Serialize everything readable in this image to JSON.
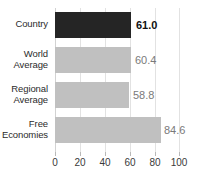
{
  "chart_data": {
    "type": "bar",
    "orientation": "horizontal",
    "title": "",
    "xlabel": "",
    "ylabel": "",
    "categories": [
      "Country",
      "World Average",
      "Regional Average",
      "Free Economies"
    ],
    "values": [
      61.0,
      60.4,
      58.8,
      84.6
    ],
    "value_labels": [
      "61.0",
      "60.4",
      "58.8",
      "84.6"
    ],
    "xlim": [
      0,
      100
    ],
    "xticks": [
      0,
      20,
      40,
      60,
      80,
      100
    ],
    "xtick_labels": [
      "0",
      "20",
      "40",
      "60",
      "80",
      "100"
    ],
    "grid": true,
    "legend": "none",
    "bar_colors": [
      "#252525",
      "#c0c0c0",
      "#c0c0c0",
      "#c0c0c0"
    ],
    "highlight_index": 0
  },
  "labels": {
    "cat0_line1": "Country",
    "cat0_line2": "",
    "cat1_line1": "World",
    "cat1_line2": "Average",
    "cat2_line1": "Regional",
    "cat2_line2": "Average",
    "cat3_line1": "Free",
    "cat3_line2": "Economies"
  },
  "axis": {
    "t0": "0",
    "t1": "20",
    "t2": "40",
    "t3": "60",
    "t4": "80",
    "t5": "100"
  },
  "values": {
    "v0": "61.0",
    "v1": "60.4",
    "v2": "58.8",
    "v3": "84.6"
  },
  "colors": {
    "highlight_bar": "#252525",
    "default_bar": "#c0c0c0",
    "gridline": "#e2e2e2",
    "text": "#2b2b2b",
    "value_text": "#7a7a7a",
    "background": "#ffffff"
  }
}
